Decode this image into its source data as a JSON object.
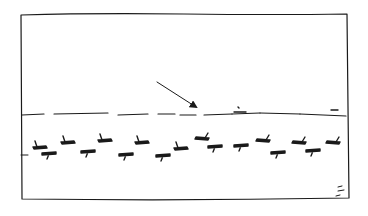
{
  "illustration": {
    "kind": "hand-drawn cartoon panel",
    "ink_color": "#1a1a1a",
    "background": "#ffffff",
    "frame": {
      "left": 21,
      "top": 14,
      "right": 347,
      "bottom": 200
    },
    "horizon": {
      "segments": [
        [
          22,
          115,
          44,
          114
        ],
        [
          54,
          114,
          108,
          113
        ],
        [
          118,
          115,
          148,
          114
        ],
        [
          158,
          114,
          175,
          114
        ],
        [
          180,
          115,
          196,
          115
        ],
        [
          204,
          115,
          232,
          114
        ],
        [
          232,
          114,
          260,
          113
        ],
        [
          260,
          113,
          300,
          114
        ],
        [
          300,
          114,
          346,
          116
        ]
      ],
      "marks": [
        {
          "x1": 234,
          "y1": 112,
          "x2": 246,
          "y2": 112
        },
        {
          "x1": 331,
          "y1": 110,
          "x2": 338,
          "y2": 110
        },
        {
          "x1": 238,
          "y1": 107,
          "x2": 239,
          "y2": 108
        }
      ]
    },
    "arrow": {
      "from": [
        157,
        82
      ],
      "to": [
        196,
        107
      ],
      "label": ""
    },
    "left_tick": {
      "x1": 21,
      "y1": 155,
      "x2": 28,
      "y2": 155
    },
    "corner_marks": [
      {
        "x1": 338,
        "y1": 187,
        "x2": 342,
        "y2": 186
      },
      {
        "x1": 338,
        "y1": 191,
        "x2": 344,
        "y2": 190
      },
      {
        "x1": 336,
        "y1": 196,
        "x2": 340,
        "y2": 195
      }
    ],
    "birds_upper_row": [
      {
        "x": 40,
        "y": 146,
        "dir": "right"
      },
      {
        "x": 68,
        "y": 141,
        "dir": "right"
      },
      {
        "x": 105,
        "y": 139,
        "dir": "right"
      },
      {
        "x": 142,
        "y": 141,
        "dir": "right"
      },
      {
        "x": 181,
        "y": 147,
        "dir": "right"
      },
      {
        "x": 202,
        "y": 137,
        "dir": "left"
      },
      {
        "x": 263,
        "y": 139,
        "dir": "left"
      },
      {
        "x": 299,
        "y": 141,
        "dir": "left"
      },
      {
        "x": 333,
        "y": 141,
        "dir": "left"
      }
    ],
    "birds_lower_row": [
      {
        "x": 49,
        "y": 154,
        "dir": "down"
      },
      {
        "x": 88,
        "y": 152,
        "dir": "down"
      },
      {
        "x": 126,
        "y": 155,
        "dir": "down"
      },
      {
        "x": 163,
        "y": 156,
        "dir": "down"
      },
      {
        "x": 215,
        "y": 147,
        "dir": "down"
      },
      {
        "x": 241,
        "y": 146,
        "dir": "down"
      },
      {
        "x": 278,
        "y": 153,
        "dir": "down"
      },
      {
        "x": 313,
        "y": 151,
        "dir": "down"
      }
    ]
  }
}
